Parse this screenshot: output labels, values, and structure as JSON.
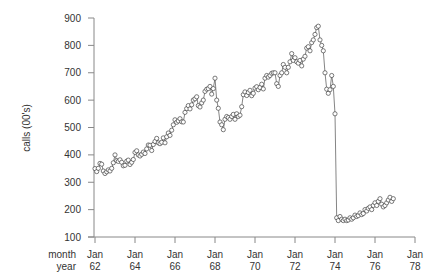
{
  "chart_data": {
    "type": "line",
    "title": "",
    "ylabel": "calls (00's)",
    "xlabel_rows": [
      "month",
      "year"
    ],
    "ylim": [
      100,
      900
    ],
    "yticks": [
      100,
      200,
      300,
      400,
      500,
      600,
      700,
      800,
      900
    ],
    "xticks": [
      {
        "month": "Jan",
        "year": "62"
      },
      {
        "month": "Jan",
        "year": "64"
      },
      {
        "month": "Jan",
        "year": "66"
      },
      {
        "month": "Jan",
        "year": "68"
      },
      {
        "month": "Jan",
        "year": "70"
      },
      {
        "month": "Jan",
        "year": "72"
      },
      {
        "month": "Jan",
        "year": "74"
      },
      {
        "month": "Jan",
        "year": "76"
      },
      {
        "month": "Jan",
        "year": "78"
      }
    ],
    "x_start": "Jan 1962",
    "x_frequency": "monthly",
    "marker": "open-circle",
    "grid": false,
    "series": [
      {
        "name": "calls",
        "values": [
          350,
          339,
          351,
          369,
          366,
          341,
          332,
          338,
          345,
          341,
          351,
          371,
          400,
          379,
          376,
          382,
          373,
          360,
          362,
          377,
          381,
          365,
          373,
          383,
          409,
          415,
          400,
          396,
          402,
          410,
          405,
          422,
          436,
          435,
          416,
          438,
          449,
          460,
          444,
          441,
          446,
          462,
          444,
          466,
          480,
          471,
          490,
          510,
          528,
          519,
          524,
          532,
          521,
          520,
          555,
          569,
          580,
          568,
          583,
          600,
          605,
          612,
          580,
          575,
          590,
          600,
          632,
          640,
          642,
          650,
          622,
          642,
          680,
          600,
          570,
          520,
          510,
          492,
          530,
          540,
          536,
          530,
          540,
          548,
          530,
          550,
          540,
          545,
          576,
          620,
          630,
          617,
          628,
          636,
          616,
          625,
          644,
          649,
          638,
          646,
          658,
          641,
          680,
          690,
          684,
          690,
          698,
          700,
          700,
          660,
          650,
          690,
          700,
          730,
          720,
          700,
          720,
          740,
          770,
          745,
          755,
          740,
          735,
          745,
          725,
          750,
          760,
          790,
          795,
          780,
          810,
          820,
          840,
          865,
          870,
          820,
          800,
          780,
          700,
          640,
          625,
          638,
          690,
          650,
          550,
          170,
          160,
          175,
          165,
          160,
          165,
          160,
          162,
          170,
          165,
          170,
          180,
          175,
          178,
          188,
          182,
          186,
          200,
          195,
          205,
          210,
          200,
          215,
          225,
          215,
          230,
          240,
          220,
          210,
          215,
          225,
          235,
          245,
          230,
          240
        ]
      }
    ]
  }
}
